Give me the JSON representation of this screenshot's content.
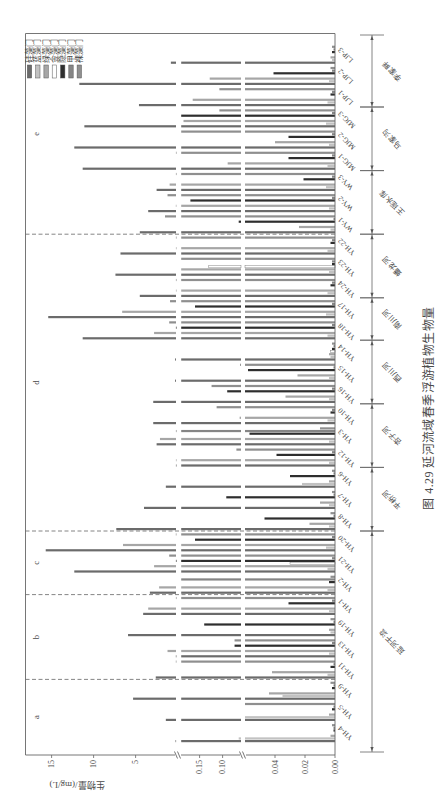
{
  "figure": {
    "caption": "图 4.29  延河流域春季浮游植物生物量"
  },
  "chart_data": {
    "type": "bar",
    "title": "图 4.29 延河流域春季浮游植物生物量",
    "xlabel": "",
    "ylabel": "生物量/(mg/L)",
    "ylim": [
      0,
      18
    ],
    "grid": false,
    "legend_position": "top-right",
    "y_axis": {
      "broken": true,
      "segments": [
        [
          0,
          0.06
        ],
        [
          0.06,
          0.19
        ],
        [
          0.19,
          18
        ]
      ],
      "ticks": [
        [
          0,
          0.02,
          0.04
        ],
        [
          0.1,
          0.15
        ],
        [
          5,
          10,
          15
        ]
      ],
      "tick_labels": [
        [
          "0.00",
          "0.02",
          "0.04"
        ],
        [
          "0.10",
          "0.15"
        ],
        [
          "5",
          "10",
          "15"
        ]
      ]
    },
    "categories": [
      "YH-4",
      "YH-5",
      "YH-9",
      "YH-11",
      "YH-13",
      "YH-19",
      "YH-1",
      "YH-2",
      "YH-21",
      "YH-20",
      "YH-8",
      "YH-7",
      "YH-6",
      "YH-12",
      "YH-3",
      "YH-10",
      "YH-16",
      "YH-15",
      "YH-14",
      "YH-18",
      "YH-17",
      "YH-24",
      "YH-23",
      "YH-22",
      "WY-1",
      "WY-2",
      "WY-3",
      "MJG-1",
      "MJG-2",
      "MJG-3",
      "LJP-1",
      "LJP-2",
      "LJP-3"
    ],
    "series": [
      {
        "name": "硅藻门",
        "color": "#6b6b6b",
        "values": [
          0.25,
          1.4,
          5.3,
          2.6,
          0.21,
          5.9,
          4.1,
          3.3,
          12.3,
          15.7,
          7.3,
          4.0,
          1.4,
          0.2,
          2.5,
          2.9,
          2.9,
          0.3,
          0.3,
          11.3,
          15.4,
          4.5,
          7.4,
          6.8,
          4.5,
          3.5,
          2.5,
          11.3,
          12.3,
          11.1,
          4.6,
          11.7,
          0.8
        ]
      },
      {
        "name": "蓝藻门",
        "color": "#c2c2c2",
        "values": [
          0.065,
          0.06,
          0.035,
          0.005,
          0.004,
          0.003,
          0.004,
          0.005,
          0.005,
          0.006,
          0.004,
          0.004,
          0.022,
          0.004,
          0.004,
          0.005,
          0.004,
          0.004,
          0.003,
          0.005,
          0.006,
          0.005,
          0.004,
          0.005,
          0.003,
          0.004,
          0.006,
          0.005,
          0.004,
          0.006,
          0.005,
          0.004,
          0.002
        ]
      },
      {
        "name": "绿藻门",
        "color": "#a6a6a6",
        "values": [
          0.003,
          0.004,
          0.044,
          0.042,
          1.2,
          0.004,
          3.5,
          2.2,
          2.8,
          6.5,
          0.017,
          0.01,
          0.004,
          0.2,
          2.1,
          0.063,
          0.033,
          0.025,
          0.004,
          2.8,
          6.6,
          0.2,
          0.19,
          0.2,
          0.024,
          0.21,
          0.95,
          0.089,
          0.04,
          0.185,
          0.165,
          0.128,
          0.003
        ]
      },
      {
        "name": "金藻门",
        "color": "#ffffff",
        "stroke": "#666666",
        "values": [
          0,
          0,
          0,
          0,
          0,
          0,
          0,
          0,
          0.03,
          0,
          0,
          0,
          0,
          0,
          0,
          0,
          0,
          0,
          0.003,
          0,
          0,
          0,
          0.13,
          0,
          0,
          0,
          0,
          0,
          0,
          0,
          0,
          0,
          0
        ]
      },
      {
        "name": "隐藻门",
        "color": "#2e2e2e",
        "values": [
          0.001,
          0.002,
          0.002,
          0.003,
          0.074,
          0.14,
          0.031,
          0.004,
          0.2,
          0.16,
          0.047,
          0.092,
          0.03,
          0.039,
          0.057,
          0.003,
          0.09,
          0.058,
          0.002,
          0.2,
          0.16,
          0.003,
          0.002,
          0.003,
          0.065,
          0.17,
          0.021,
          0.031,
          0.031,
          0.19,
          0.003,
          0.041,
          0.002
        ]
      },
      {
        "name": "甲藻门",
        "color": "#858585",
        "values": [
          0.001,
          0.001,
          0.001,
          0.001,
          0.002,
          0.001,
          0.002,
          0.19,
          0.002,
          0.002,
          0.001,
          0.001,
          0.001,
          0.002,
          0.2,
          0.002,
          0.002,
          0.001,
          0.001,
          0.002,
          0.002,
          0.002,
          0.002,
          0.002,
          0.001,
          0.002,
          0.002,
          0.002,
          0.002,
          0.002,
          0.002,
          0.002,
          0.001
        ]
      },
      {
        "name": "裸藻门",
        "color": "#8f8f8f",
        "values": [
          0.002,
          0.06,
          0.003,
          0.21,
          0.074,
          0.003,
          0.2,
          0.003,
          1.0,
          0.21,
          0.003,
          0.002,
          0.002,
          0.07,
          0.01,
          0.113,
          0.124,
          0.062,
          0.002,
          1.0,
          0.9,
          0.2,
          0.19,
          0.2,
          1.5,
          1.2,
          0.2,
          0.2,
          0.19,
          0.107,
          0.107,
          0.003,
          0.002
        ]
      }
    ],
    "groups": [
      {
        "name": "延河干流",
        "categories": [
          "YH-4",
          "YH-5",
          "YH-9",
          "YH-11",
          "YH-13",
          "YH-19",
          "YH-1",
          "YH-2",
          "YH-21",
          "YH-20"
        ]
      },
      {
        "name": "平桥河",
        "categories": [
          "YH-8",
          "YH-7",
          "YH-6"
        ]
      },
      {
        "name": "杏子河",
        "categories": [
          "YH-12",
          "YH-3",
          "YH-10"
        ]
      },
      {
        "name": "西川河",
        "categories": [
          "YH-16",
          "YH-15",
          "YH-14"
        ]
      },
      {
        "name": "南川河",
        "categories": [
          "YH-18",
          "YH-17"
        ]
      },
      {
        "name": "蟠龙河",
        "categories": [
          "YH-24",
          "YH-23",
          "YH-22"
        ]
      },
      {
        "name": "王瑶水库",
        "categories": [
          "WY-1",
          "WY-2",
          "WY-3"
        ]
      },
      {
        "name": "马家沟",
        "categories": [
          "MJG-1",
          "MJG-2",
          "MJG-3"
        ]
      },
      {
        "name": "李家畔",
        "categories": [
          "LJP-1",
          "LJP-2",
          "LJP-3"
        ]
      }
    ],
    "panels": [
      {
        "label": "a",
        "categories": [
          "YH-4",
          "YH-5",
          "YH-9"
        ]
      },
      {
        "label": "b",
        "categories": [
          "YH-11",
          "YH-13",
          "YH-19",
          "YH-1"
        ]
      },
      {
        "label": "c",
        "categories": [
          "YH-2",
          "YH-21",
          "YH-20"
        ]
      },
      {
        "label": "d",
        "categories": [
          "YH-8",
          "YH-7",
          "YH-6",
          "YH-12",
          "YH-3",
          "YH-10",
          "YH-16",
          "YH-15",
          "YH-14",
          "YH-18",
          "YH-17",
          "YH-24",
          "YH-23",
          "YH-22"
        ]
      },
      {
        "label": "e",
        "categories": [
          "WY-1",
          "WY-2",
          "WY-3",
          "MJG-1",
          "MJG-2",
          "MJG-3",
          "LJP-1",
          "LJP-2",
          "LJP-3"
        ]
      }
    ]
  }
}
